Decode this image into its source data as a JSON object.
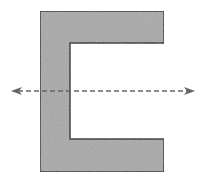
{
  "diagram": {
    "type": "channel-section-cross-section",
    "shape": {
      "name": "C-shape",
      "fill": "#a8a8a8",
      "stroke": "#222222",
      "outer": {
        "left": 40,
        "top": 11,
        "right": 164,
        "bottom": 172
      },
      "inner": {
        "left": 70,
        "top": 43,
        "bottom": 139
      }
    },
    "axis": {
      "name": "horizontal-axis",
      "style": "dashed",
      "color": "#666666",
      "y": 91,
      "x_start": 11,
      "x_end": 195,
      "arrowheads": "both"
    }
  }
}
